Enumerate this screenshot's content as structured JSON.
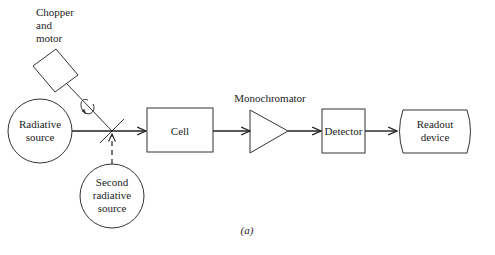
{
  "diagram": {
    "caption": "(a)",
    "components": {
      "chopper": {
        "line1": "Chopper",
        "line2": "and",
        "line3": "motor"
      },
      "source": {
        "line1": "Radiative",
        "line2": "source"
      },
      "second_source": {
        "line1": "Second",
        "line2": "radiative",
        "line3": "source"
      },
      "cell": {
        "label": "Cell"
      },
      "monochromator": {
        "label": "Monochromator"
      },
      "detector": {
        "label": "Detector"
      },
      "readout": {
        "line1": "Readout",
        "line2": "device"
      }
    },
    "flow": [
      "Radiative source",
      "Chopper",
      "Cell",
      "Monochromator",
      "Detector",
      "Readout device"
    ]
  }
}
